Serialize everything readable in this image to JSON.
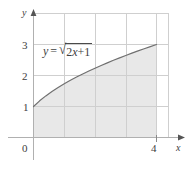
{
  "figure": {
    "kind": "math-graph",
    "background_color": "#ffffff",
    "shade_color": "#e8e8e8",
    "grid_color": "#cfcfcf",
    "curve_color": "#6e6e6e",
    "axis_color": "#b5b5b5",
    "text_color": "#3d3d3d"
  },
  "labels": {
    "y_axis": "y",
    "x_axis": "x",
    "origin": "0"
  },
  "curve_label": {
    "lhs": "y",
    "equals": "=",
    "radical_sign": "√",
    "radicand_coefficient": "2",
    "radicand_variable": "x",
    "radicand_operator": "+",
    "radicand_constant": "1",
    "full_text": "y = √(2x + 1)"
  },
  "chart_data": {
    "type": "line",
    "title": "",
    "xlabel": "x",
    "ylabel": "y",
    "function": "y = sqrt(2x + 1)",
    "xlim": [
      0,
      4.4
    ],
    "ylim": [
      0,
      3.6
    ],
    "grid": true,
    "legend": "none",
    "x_ticks": [
      0,
      4
    ],
    "x_tick_labels": [
      "0",
      "4"
    ],
    "y_ticks": [
      1,
      2,
      3
    ],
    "y_tick_labels": [
      "1",
      "2",
      "3"
    ],
    "gridlines_x": [
      1,
      2,
      3,
      4
    ],
    "gridlines_y": [
      1,
      2,
      3
    ],
    "shaded_region": {
      "from_x": 0,
      "to_x": 4,
      "from_y": 0,
      "description": "area under curve from x=0 to x=4"
    },
    "x": [
      0,
      0.2,
      0.4,
      0.6,
      0.8,
      1.0,
      1.2,
      1.4,
      1.6,
      1.8,
      2.0,
      2.2,
      2.4,
      2.6,
      2.8,
      3.0,
      3.2,
      3.4,
      3.6,
      3.8,
      4.0
    ],
    "values": [
      1.0,
      1.183,
      1.342,
      1.483,
      1.612,
      1.732,
      1.844,
      1.949,
      2.049,
      2.145,
      2.236,
      2.324,
      2.408,
      2.49,
      2.569,
      2.646,
      2.72,
      2.793,
      2.864,
      2.933,
      3.0
    ],
    "endpoints": [
      [
        0,
        1
      ],
      [
        4,
        3
      ]
    ]
  }
}
